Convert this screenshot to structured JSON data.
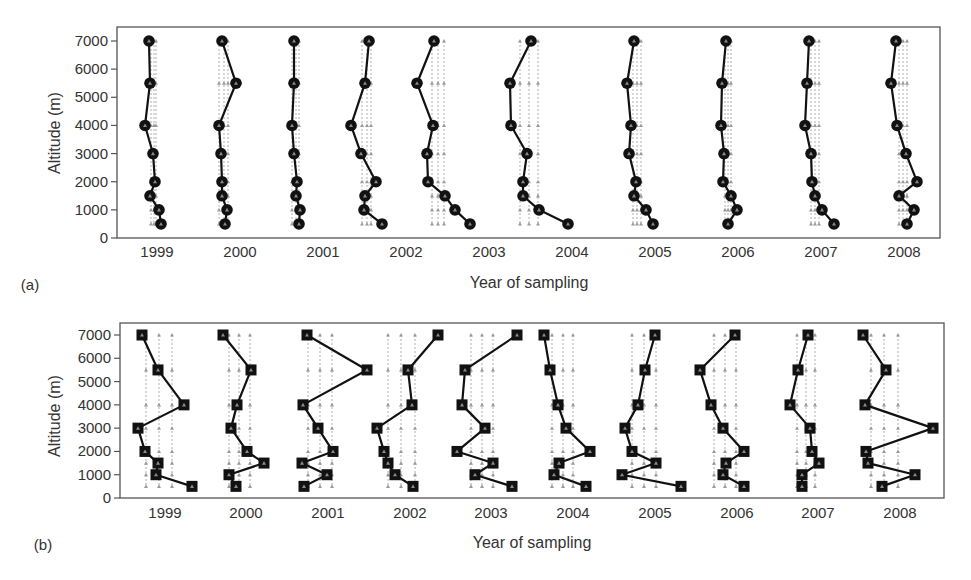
{
  "figure": {
    "width": 971,
    "height": 580,
    "colors": {
      "profile": "#111111",
      "frame": "#555555",
      "refline": "#9a9a9a",
      "marker_inner": "#8a8a8a",
      "text": "#333333"
    }
  },
  "chart_data": [
    {
      "panel": "(a)",
      "type": "line",
      "marker": "circle",
      "title": "",
      "xlabel": "Year of sampling",
      "ylabel": "Altitude (m)",
      "ylim": [
        0,
        7000
      ],
      "yticks": [
        0,
        1000,
        2000,
        3000,
        4000,
        5000,
        6000,
        7000
      ],
      "categories": [
        "1999",
        "2000",
        "2001",
        "2002",
        "2003",
        "2004",
        "2005",
        "2006",
        "2007",
        "2008"
      ],
      "altitudes": [
        7000,
        5500,
        4000,
        3000,
        2000,
        1500,
        1000,
        500
      ],
      "grid": false,
      "frame": {
        "x0": 117,
        "x1": 940,
        "y_top": 27,
        "y_zero": 238,
        "y_7000": 41
      },
      "tick_label_x": [
        157,
        240,
        323,
        406,
        489,
        572,
        655,
        738,
        821,
        904
      ],
      "tick_label_y": 257,
      "xlabel_pos": [
        529,
        288
      ],
      "tag_pos": [
        30,
        290
      ],
      "ylabel_pos": [
        60,
        133
      ],
      "series": [
        {
          "name": "1999",
          "x_px": [
            149,
            150,
            145,
            153,
            155,
            150,
            159,
            161
          ],
          "ref_px": [
            151,
            154,
            156
          ]
        },
        {
          "name": "2000",
          "x_px": [
            222,
            236,
            219,
            221,
            222,
            222,
            227,
            225
          ],
          "ref_px": [
            219,
            224,
            228
          ]
        },
        {
          "name": "2001",
          "x_px": [
            294,
            294,
            292,
            294,
            297,
            296,
            300,
            299
          ],
          "ref_px": [
            292,
            296,
            299
          ]
        },
        {
          "name": "2002",
          "x_px": [
            369,
            365,
            351,
            361,
            376,
            365,
            364,
            382
          ],
          "ref_px": [
            362,
            367,
            371
          ]
        },
        {
          "name": "2003",
          "x_px": [
            434,
            417,
            433,
            427,
            428,
            445,
            455,
            470
          ],
          "ref_px": [
            432,
            438,
            444
          ]
        },
        {
          "name": "2004",
          "x_px": [
            531,
            510,
            511,
            527,
            523,
            523,
            539,
            568
          ],
          "ref_px": [
            520,
            529,
            538
          ]
        },
        {
          "name": "2005",
          "x_px": [
            634,
            627,
            631,
            629,
            636,
            634,
            646,
            653
          ],
          "ref_px": [
            633,
            637,
            641
          ]
        },
        {
          "name": "2006",
          "x_px": [
            726,
            722,
            721,
            724,
            723,
            731,
            737,
            728
          ],
          "ref_px": [
            725,
            728,
            731
          ]
        },
        {
          "name": "2007",
          "x_px": [
            809,
            807,
            805,
            811,
            812,
            815,
            822,
            834
          ],
          "ref_px": [
            811,
            815,
            819
          ]
        },
        {
          "name": "2008",
          "x_px": [
            896,
            891,
            897,
            906,
            917,
            899,
            914,
            907
          ],
          "ref_px": [
            899,
            903,
            907
          ]
        }
      ]
    },
    {
      "panel": "(b)",
      "type": "line",
      "marker": "square",
      "title": "",
      "xlabel": "Year of sampling",
      "ylabel": "Altitude (m)",
      "ylim": [
        0,
        7000
      ],
      "yticks": [
        0,
        1000,
        2000,
        3000,
        4000,
        5000,
        6000,
        7000
      ],
      "categories": [
        "1999",
        "2000",
        "2001",
        "2002",
        "2003",
        "2004",
        "2005",
        "2006",
        "2007",
        "2008"
      ],
      "altitudes": [
        7000,
        5500,
        4000,
        3000,
        2000,
        1500,
        1000,
        500
      ],
      "grid": false,
      "frame": {
        "x0": 120,
        "x1": 944,
        "y_top": 323,
        "y_zero": 498,
        "y_7000": 335
      },
      "tick_label_x": [
        165,
        246,
        328,
        410,
        491,
        573,
        655,
        737,
        818,
        900
      ],
      "tick_label_y": 518,
      "xlabel_pos": [
        532,
        548
      ],
      "tag_pos": [
        43,
        550
      ],
      "ylabel_pos": [
        60,
        416
      ],
      "series": [
        {
          "name": "1999",
          "x_px": [
            142,
            158,
            184,
            138,
            145,
            158,
            156,
            192
          ],
          "ref_px": [
            146,
            159,
            172
          ]
        },
        {
          "name": "2000",
          "x_px": [
            223,
            251,
            237,
            231,
            247,
            264,
            229,
            236
          ],
          "ref_px": [
            229,
            239,
            250
          ]
        },
        {
          "name": "2001",
          "x_px": [
            307,
            367,
            303,
            318,
            333,
            302,
            327,
            304
          ],
          "ref_px": [
            308,
            320,
            332
          ]
        },
        {
          "name": "2002",
          "x_px": [
            438,
            408,
            412,
            377,
            384,
            388,
            395,
            413
          ],
          "ref_px": [
            388,
            401,
            415
          ]
        },
        {
          "name": "2003",
          "x_px": [
            517,
            465,
            462,
            485,
            457,
            493,
            475,
            512
          ],
          "ref_px": [
            471,
            482,
            493
          ]
        },
        {
          "name": "2004",
          "x_px": [
            544,
            550,
            558,
            566,
            590,
            559,
            554,
            586
          ],
          "ref_px": [
            552,
            563,
            573
          ]
        },
        {
          "name": "2005",
          "x_px": [
            655,
            645,
            638,
            625,
            632,
            656,
            622,
            681
          ],
          "ref_px": [
            632,
            644,
            656
          ]
        },
        {
          "name": "2006",
          "x_px": [
            735,
            700,
            711,
            723,
            744,
            726,
            723,
            744
          ],
          "ref_px": [
            714,
            725,
            736
          ]
        },
        {
          "name": "2007",
          "x_px": [
            808,
            798,
            790,
            810,
            812,
            819,
            802,
            802
          ],
          "ref_px": [
            797,
            806,
            815
          ]
        },
        {
          "name": "2008",
          "x_px": [
            863,
            886,
            865,
            933,
            866,
            868,
            915,
            882
          ],
          "ref_px": [
            871,
            884,
            898
          ]
        }
      ]
    }
  ]
}
